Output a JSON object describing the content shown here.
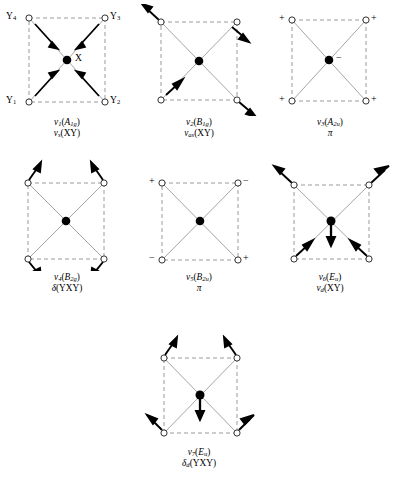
{
  "figure": {
    "molecule": "square planar XY4",
    "atom_labels": {
      "center": "X",
      "corner_top_left": "Y4",
      "corner_top_right": "Y3",
      "corner_bottom_left": "Y1",
      "corner_bottom_right": "Y2"
    },
    "sign_plus": "+",
    "sign_minus": "−",
    "footer_caption": ""
  },
  "panels": [
    {
      "id": "p1",
      "name": "mode-nu1",
      "mode_number": "1",
      "symmetry": "A",
      "symmetry_sub": "1g",
      "line1_prefix": "ν",
      "line1_sub": "1",
      "line2_symbol": "ν",
      "line2_sub": "s",
      "line2_text": "(XY)",
      "shows_corner_labels": true,
      "shows_center_label": true,
      "signs": [],
      "arrows": "all four corner arrows point inward toward center",
      "center_arrow": "none"
    },
    {
      "id": "p2",
      "name": "mode-nu2",
      "mode_number": "2",
      "symmetry": "B",
      "symmetry_sub": "1g",
      "line1_prefix": "ν",
      "line1_sub": "2",
      "line2_symbol": "ν",
      "line2_sub": "as",
      "line2_text": "(XY)",
      "shows_corner_labels": false,
      "shows_center_label": false,
      "signs": [],
      "arrows": "top-left and bottom-right outward; top-right and bottom-left inward",
      "center_arrow": "none"
    },
    {
      "id": "p3",
      "name": "mode-nu3",
      "mode_number": "3",
      "symmetry": "A",
      "symmetry_sub": "2u",
      "line1_prefix": "ν",
      "line1_sub": "3",
      "line2_symbol": "π",
      "line2_sub": "",
      "line2_text": "",
      "shows_corner_labels": false,
      "shows_center_label": false,
      "signs": [
        {
          "pos": "top-left",
          "value": "+"
        },
        {
          "pos": "top-right",
          "value": "+"
        },
        {
          "pos": "bottom-left",
          "value": "+"
        },
        {
          "pos": "bottom-right",
          "value": "+"
        },
        {
          "pos": "center",
          "value": "−"
        }
      ],
      "arrows": "none",
      "center_arrow": "none"
    },
    {
      "id": "p4",
      "name": "mode-nu4",
      "mode_number": "4",
      "symmetry": "B",
      "symmetry_sub": "2g",
      "line1_prefix": "ν",
      "line1_sub": "4",
      "line2_symbol": "δ",
      "line2_sub": "",
      "line2_text": "(YXY)",
      "shows_corner_labels": false,
      "shows_center_label": false,
      "signs": [],
      "arrows": "in-plane bend: top corners up-outward, bottom corners down-outward",
      "center_arrow": "none"
    },
    {
      "id": "p5",
      "name": "mode-nu5",
      "mode_number": "5",
      "symmetry": "B",
      "symmetry_sub": "2u",
      "line1_prefix": "ν",
      "line1_sub": "5",
      "line2_symbol": "π",
      "line2_sub": "",
      "line2_text": "",
      "shows_corner_labels": false,
      "shows_center_label": false,
      "signs": [
        {
          "pos": "top-left",
          "value": "+"
        },
        {
          "pos": "top-right",
          "value": "−"
        },
        {
          "pos": "bottom-left",
          "value": "−"
        },
        {
          "pos": "bottom-right",
          "value": "+"
        }
      ],
      "arrows": "none",
      "center_arrow": "none"
    },
    {
      "id": "p6",
      "name": "mode-nu6",
      "mode_number": "6",
      "symmetry": "E",
      "symmetry_sub": "u",
      "line1_prefix": "ν",
      "line1_sub": "6",
      "line2_symbol": "ν",
      "line2_sub": "d",
      "line2_text": "(XY)",
      "shows_corner_labels": false,
      "shows_center_label": false,
      "signs": [],
      "arrows": "top corners up-outward, bottom corners up-inward",
      "center_arrow": "down"
    },
    {
      "id": "p7",
      "name": "mode-nu7",
      "mode_number": "7",
      "symmetry": "E",
      "symmetry_sub": "u",
      "line1_prefix": "ν",
      "line1_sub": "7",
      "line2_symbol": "δ",
      "line2_sub": "d",
      "line2_text": "(YXY)",
      "shows_corner_labels": false,
      "shows_center_label": false,
      "signs": [],
      "arrows": "top corners up-outward, bottom corners down-outward",
      "center_arrow": "down"
    }
  ]
}
